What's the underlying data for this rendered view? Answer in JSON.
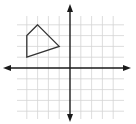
{
  "diagram": {
    "type": "coordinate-plane",
    "grid": {
      "min": -4,
      "max": 4,
      "cell_px": 10.8,
      "origin_px": [
        70,
        68
      ],
      "extent_px": {
        "x0": 17,
        "x1": 124,
        "y0": 16,
        "y1": 119
      },
      "line_color": "#d4d4d4",
      "axis_color": "#1a1a1a",
      "shape_color": "#333333"
    },
    "axes": {
      "x_arrow_left_tip": 3,
      "x_arrow_right_tip": 131,
      "y_arrow_top_tip": 4,
      "y_arrow_bottom_tip": 122
    },
    "shape": {
      "name": "quadrilateral",
      "vertices": [
        [
          -3,
          4
        ],
        [
          -4,
          3
        ],
        [
          -4,
          1
        ],
        [
          -1,
          2
        ]
      ]
    }
  }
}
